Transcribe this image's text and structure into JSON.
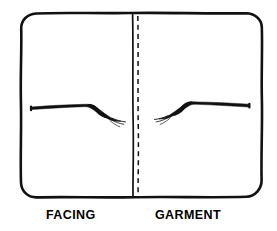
{
  "figure": {
    "background_color": "#ffffff",
    "ink_color": "#111111",
    "panel": {
      "name": "fabric-panel-outline",
      "style": "hand-drawn-rounded-rectangle",
      "x": 21,
      "y": 13,
      "width": 241,
      "height": 185,
      "stroke_width": 2.6,
      "corner_radius": 14
    },
    "seam_line": {
      "name": "center-seam-solid-line",
      "x": 133,
      "y_top": 14,
      "y_bottom": 197,
      "stroke_width": 1.6,
      "color": "#111111"
    },
    "stitch_line": {
      "name": "center-stitching-dashed-line",
      "x": 138,
      "y_top": 16,
      "y_bottom": 196,
      "stroke_width": 1.5,
      "dash": "5 4",
      "color": "#111111"
    },
    "threads": [
      {
        "name": "facing-thread-mark",
        "side": "left",
        "description": "tapered thread bending downward toward the seam with frayed tip",
        "start_x": 31,
        "start_y": 108,
        "bend_x": 93,
        "bend_y": 105,
        "end_x": 122,
        "end_y": 121
      },
      {
        "name": "garment-thread-mark",
        "side": "right",
        "description": "mirror-image tapered thread bending downward away from the seam with frayed tip",
        "start_x": 249,
        "start_y": 105,
        "bend_x": 186,
        "bend_y": 103,
        "end_x": 155,
        "end_y": 120
      }
    ]
  },
  "labels": {
    "left": "FACING",
    "right": "GARMENT"
  }
}
